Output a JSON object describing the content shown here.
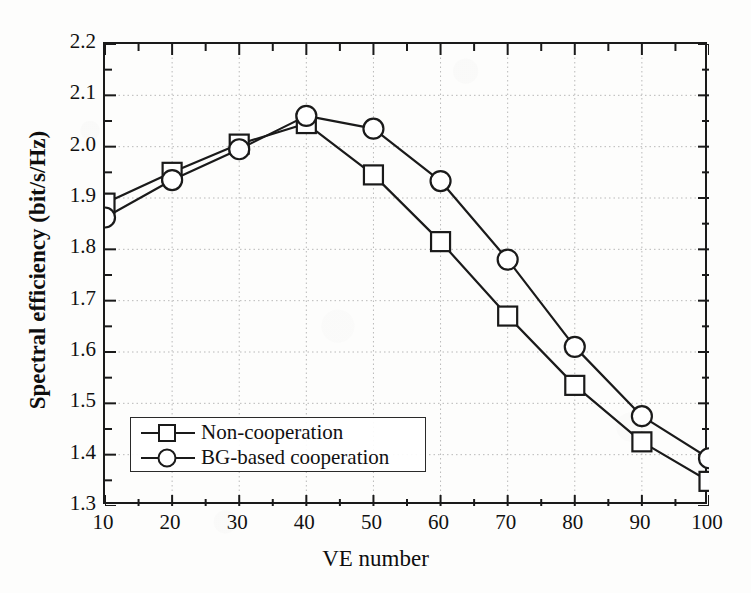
{
  "chart_data": {
    "type": "line",
    "title": "",
    "xlabel": "VE number",
    "ylabel": "Spectral efficiency (bit/s/Hz)",
    "x": [
      10,
      20,
      30,
      40,
      50,
      60,
      70,
      80,
      90,
      100
    ],
    "xlim": [
      10,
      100
    ],
    "ylim": [
      1.3,
      2.2
    ],
    "xticks": [
      "10",
      "20",
      "30",
      "40",
      "50",
      "60",
      "70",
      "80",
      "90",
      "100"
    ],
    "yticks": [
      "1.3",
      "1.4",
      "1.5",
      "1.6",
      "1.7",
      "1.8",
      "1.9",
      "2.0",
      "2.1",
      "2.2"
    ],
    "ytick_values": [
      1.3,
      1.4,
      1.5,
      1.6,
      1.7,
      1.8,
      1.9,
      2.0,
      2.1,
      2.2
    ],
    "y_minor_step": 0.05,
    "grid": "dotted-both",
    "legend_position": "lower-left-inside",
    "series": [
      {
        "name": "Non-cooperation",
        "marker": "open-square",
        "values": [
          1.89,
          1.95,
          2.005,
          2.045,
          1.945,
          1.815,
          1.67,
          1.535,
          1.425,
          1.348
        ]
      },
      {
        "name": "BG-based cooperation",
        "marker": "open-circle",
        "values": [
          1.862,
          1.935,
          1.995,
          2.06,
          2.035,
          1.933,
          1.78,
          1.61,
          1.475,
          1.393
        ]
      }
    ]
  },
  "legend": {
    "items": [
      {
        "label": "Non-cooperation",
        "marker": "open-square"
      },
      {
        "label": "BG-based cooperation",
        "marker": "open-circle"
      }
    ]
  },
  "axes": {
    "x_title": "VE number",
    "y_title": "Spectral efficiency (bit/s/Hz)"
  },
  "colors": {
    "line": "#1a1a1a",
    "frame": "#1a1a1a",
    "grid": "#b9b9b9",
    "background": "#fdfdfc",
    "text": "#111111"
  }
}
